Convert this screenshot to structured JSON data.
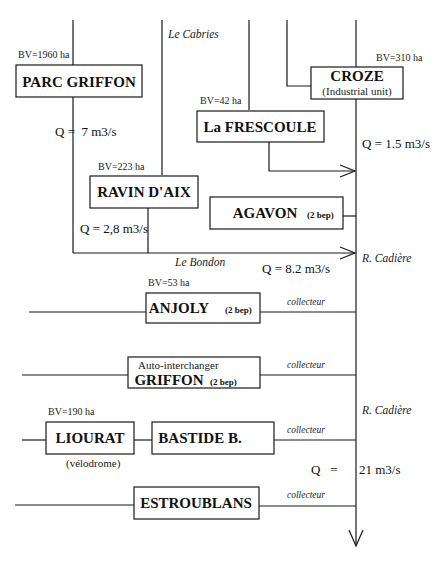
{
  "nodes": {
    "parc_griffon": {
      "label": "PARC GRIFFON",
      "bv": "BV=1960 ha"
    },
    "croze": {
      "label": "CROZE",
      "sub": "(Industrial unit)",
      "bv": "BV=310 ha"
    },
    "la_frescoule": {
      "label": "La FRESCOULE",
      "bv": "BV=42 ha"
    },
    "ravin_daix": {
      "label": "RAVIN D'AIX",
      "bv": "BV=223 ha"
    },
    "agavon": {
      "label": "AGAVON",
      "tag": "(2 bep)"
    },
    "anjoly": {
      "label": "ANJOLY",
      "tag": "(2 bep)",
      "bv": "BV=53 ha"
    },
    "griffon": {
      "label": "GRIFFON",
      "tag": "(2 bep)",
      "sub": "Auto-interchanger"
    },
    "liourat": {
      "label": "LIOURAT",
      "sub": "(vélodrome)",
      "bv": "BV=190 ha"
    },
    "bastide": {
      "label": "BASTIDE B."
    },
    "estroublans": {
      "label": "ESTROUBLANS"
    }
  },
  "streams": {
    "le_cabries": "Le Cabries",
    "le_bondon": "Le Bondon",
    "r_cadiere_1": "R. Cadière",
    "r_cadiere_2": "R. Cadière",
    "collecteur_1": "collecteur",
    "collecteur_2": "collecteur",
    "collecteur_3": "collecteur",
    "collecteur_4": "collecteur"
  },
  "flows": {
    "q_parc": "Q =  7 m3/s",
    "q_croze": "Q = 1.5 m3/s",
    "q_ravin": "Q = 2,8 m3/s",
    "q_bondon": "Q = 8.2 m3/s",
    "q_final_label": "Q   =",
    "q_final_value": "21 m3/s"
  }
}
